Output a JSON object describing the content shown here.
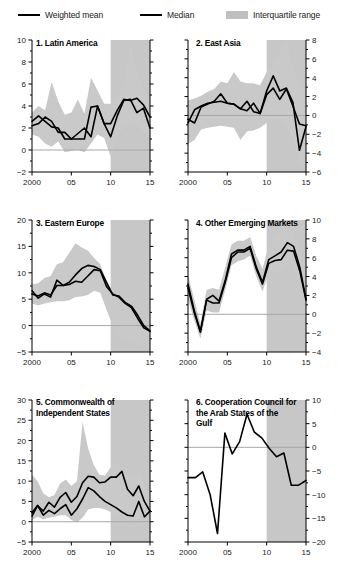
{
  "legend": {
    "items": [
      {
        "label": "Weighted mean",
        "marker": "line",
        "color": "#000000"
      },
      {
        "label": "Median",
        "marker": "line",
        "color": "#000000"
      },
      {
        "label": "Interquartile range",
        "marker": "band",
        "color": "#bfbfbf"
      }
    ]
  },
  "colors": {
    "line": "#000000",
    "iqr_band": "#c9c9c9",
    "forecast_shade": "#b2b2b2",
    "zero_line": "#a8a8a8",
    "axis": "#000000",
    "background": "#ffffff"
  },
  "chart_data": [
    {
      "type": "line",
      "title": "1. Latin America",
      "panel_number": 1,
      "xlabel": "",
      "ylabel": "",
      "axis_side": "left",
      "xlim": [
        2000,
        2015
      ],
      "ylim": [
        -2,
        10
      ],
      "yticks": [
        -2,
        0,
        2,
        4,
        6,
        8,
        10
      ],
      "xticks": [
        2000,
        2005,
        2010,
        2015
      ],
      "xtick_labels": [
        "2000",
        "05",
        "10",
        "15"
      ],
      "grid": false,
      "zero_line": true,
      "shaded_region": {
        "from": 2010,
        "to": 2015,
        "note": "forecast"
      },
      "x": [
        2000,
        2001,
        2002,
        2003,
        2004,
        2005,
        2006,
        2007,
        2008,
        2009,
        2010,
        2011,
        2012,
        2013,
        2014,
        2015
      ],
      "series": [
        {
          "name": "Weighted mean",
          "values": [
            2.6,
            3.1,
            2.6,
            2.1,
            2.0,
            1.0,
            1.0,
            1.5,
            2.0,
            1.2,
            4.0,
            2.4,
            2.4,
            3.6,
            4.6,
            4.5,
            4.7,
            4.1,
            3.0
          ]
        },
        {
          "name": "Median",
          "values": [
            2.2,
            2.4,
            3.0,
            2.6,
            1.6,
            1.6,
            1.0,
            1.0,
            1.0,
            3.9,
            4.0,
            2.4,
            1.2,
            3.1,
            4.5,
            4.6,
            3.4,
            3.8,
            2.0
          ]
        }
      ],
      "iqr": {
        "lower": [
          1.4,
          1.2,
          0.6,
          0.3,
          0.8,
          -0.2,
          -0.1,
          0.0,
          -0.2,
          0.6,
          1.4,
          1.1,
          -0.6,
          1.2,
          2.0,
          2.4,
          2.3,
          1.6,
          0.9
        ],
        "upper": [
          3.4,
          4.0,
          3.6,
          6.2,
          4.4,
          3.2,
          3.4,
          4.6,
          3.3,
          6.6,
          5.4,
          4.2,
          4.2,
          4.9,
          6.1,
          9.7,
          7.2,
          5.4,
          4.6
        ]
      }
    },
    {
      "type": "line",
      "title": "2. East Asia",
      "panel_number": 2,
      "xlabel": "",
      "ylabel": "",
      "axis_side": "right",
      "xlim": [
        2000,
        2015
      ],
      "ylim": [
        -6,
        8
      ],
      "yticks": [
        -6,
        -4,
        -2,
        0,
        2,
        4,
        6,
        8
      ],
      "xticks": [
        2000,
        2005,
        2010,
        2015
      ],
      "xtick_labels": [
        "2000",
        "05",
        "10",
        "15"
      ],
      "grid": false,
      "zero_line": true,
      "shaded_region": {
        "from": 2010,
        "to": 2015,
        "note": "forecast"
      },
      "x": [
        2000,
        2001,
        2002,
        2003,
        2004,
        2005,
        2006,
        2007,
        2008,
        2009,
        2010,
        2011,
        2012,
        2013,
        2014,
        2015
      ],
      "series": [
        {
          "name": "Weighted mean",
          "values": [
            -0.8,
            0.6,
            1.0,
            1.3,
            1.4,
            1.5,
            1.3,
            1.2,
            0.7,
            1.5,
            0.4,
            0.2,
            2.6,
            4.2,
            2.6,
            2.9,
            1.4,
            -3.7,
            -1.2
          ]
        },
        {
          "name": "Median",
          "values": [
            -0.4,
            -0.8,
            0.9,
            1.2,
            1.5,
            2.3,
            1.3,
            1.2,
            0.7,
            0.5,
            1.3,
            0.2,
            2.2,
            2.9,
            1.7,
            2.8,
            1.0,
            -0.9,
            -1.1
          ]
        }
      ],
      "iqr": {
        "lower": [
          -3.0,
          -2.6,
          -1.5,
          -1.3,
          -1.2,
          -1.1,
          -1.2,
          -1.3,
          -2.6,
          -1.7,
          -1.6,
          -1.3,
          -0.8,
          -0.6,
          -0.4,
          -1.2,
          -2.4,
          -5.0,
          -5.8
        ],
        "upper": [
          1.6,
          1.8,
          2.1,
          2.5,
          2.8,
          3.6,
          3.4,
          4.6,
          3.6,
          3.4,
          3.4,
          3.2,
          4.6,
          5.6,
          6.8,
          7.8,
          5.2,
          3.2,
          2.4
        ]
      }
    },
    {
      "type": "line",
      "title": "3. Eastern Europe",
      "panel_number": 3,
      "xlabel": "",
      "ylabel": "",
      "axis_side": "left",
      "xlim": [
        2000,
        2015
      ],
      "ylim": [
        -5,
        20
      ],
      "yticks": [
        -5,
        0,
        5,
        10,
        15,
        20
      ],
      "xticks": [
        2000,
        2005,
        2010,
        2015
      ],
      "xtick_labels": [
        "2000",
        "05",
        "10",
        "15"
      ],
      "grid": false,
      "zero_line": true,
      "shaded_region": {
        "from": 2010,
        "to": 2015,
        "note": "forecast"
      },
      "x": [
        2000,
        2001,
        2002,
        2003,
        2004,
        2005,
        2006,
        2007,
        2008,
        2009,
        2010,
        2011,
        2012,
        2013,
        2014,
        2015
      ],
      "series": [
        {
          "name": "Weighted mean",
          "values": [
            6.6,
            5.2,
            6.0,
            5.4,
            8.6,
            7.6,
            8.2,
            9.6,
            10.8,
            11.4,
            11.2,
            10.6,
            8.2,
            5.8,
            5.6,
            4.4,
            3.7,
            2.0,
            0.0,
            -1.0
          ]
        },
        {
          "name": "Median",
          "values": [
            6.0,
            5.6,
            6.2,
            5.8,
            7.6,
            7.6,
            7.8,
            8.4,
            8.2,
            9.4,
            10.6,
            10.4,
            7.4,
            6.0,
            5.4,
            4.2,
            3.4,
            1.4,
            -0.4,
            -1.1
          ]
        }
      ],
      "iqr": {
        "lower": [
          4.2,
          3.8,
          4.2,
          4.4,
          4.6,
          4.6,
          4.8,
          5.4,
          5.5,
          5.8,
          6.6,
          6.2,
          3.0,
          0.0,
          -2.4,
          -2.6,
          -3.2,
          -3.6,
          -3.6,
          -3.8
        ],
        "upper": [
          7.8,
          8.0,
          9.0,
          9.4,
          11.6,
          12.0,
          13.8,
          15.6,
          14.8,
          14.2,
          12.8,
          11.6,
          8.4,
          6.6,
          5.8,
          5.4,
          4.6,
          3.0,
          1.2,
          0.6
        ]
      }
    },
    {
      "type": "line",
      "title": "4. Other Emerging Markets",
      "panel_number": 4,
      "xlabel": "",
      "ylabel": "",
      "axis_side": "right",
      "xlim": [
        2000,
        2015
      ],
      "ylim": [
        -4,
        10
      ],
      "yticks": [
        -4,
        -2,
        0,
        2,
        4,
        6,
        8,
        10
      ],
      "xticks": [
        2000,
        2005,
        2010,
        2015
      ],
      "xtick_labels": [
        "2000",
        "05",
        "10",
        "15"
      ],
      "grid": false,
      "zero_line": true,
      "shaded_region": {
        "from": 2010,
        "to": 2015,
        "note": "forecast"
      },
      "x": [
        2000,
        2001,
        2002,
        2003,
        2004,
        2005,
        2006,
        2007,
        2008,
        2009,
        2010,
        2011,
        2012,
        2013,
        2014,
        2015
      ],
      "series": [
        {
          "name": "Weighted mean",
          "values": [
            3.2,
            0.4,
            -1.8,
            1.6,
            2.0,
            1.4,
            3.6,
            6.4,
            6.8,
            6.8,
            7.2,
            5.0,
            3.4,
            5.8,
            6.2,
            6.6,
            7.6,
            7.2,
            5.0,
            1.6
          ]
        },
        {
          "name": "Median",
          "values": [
            2.8,
            0.2,
            -1.9,
            1.5,
            1.2,
            1.2,
            3.4,
            6.0,
            6.6,
            6.6,
            7.0,
            4.8,
            3.2,
            5.4,
            5.7,
            5.8,
            6.8,
            6.7,
            4.6,
            1.5
          ]
        }
      ],
      "iqr": {
        "lower": [
          1.6,
          -0.6,
          -2.6,
          0.4,
          0.2,
          0.2,
          2.6,
          5.2,
          5.6,
          5.8,
          6.2,
          4.0,
          2.4,
          4.4,
          4.6,
          4.6,
          5.4,
          5.2,
          3.4,
          0.6
        ],
        "upper": [
          4.2,
          1.6,
          -1.0,
          2.6,
          2.8,
          2.6,
          5.0,
          7.4,
          7.8,
          7.8,
          8.2,
          6.2,
          4.8,
          7.4,
          8.4,
          9.0,
          9.2,
          8.6,
          6.6,
          3.0
        ]
      }
    },
    {
      "type": "line",
      "title": "5. Commonwealth of\nIndependent States",
      "panel_number": 5,
      "xlabel": "",
      "ylabel": "",
      "axis_side": "left",
      "xlim": [
        2000,
        2015
      ],
      "ylim": [
        -5,
        30
      ],
      "yticks": [
        -5,
        0,
        5,
        10,
        15,
        20,
        25,
        30
      ],
      "xticks": [
        2000,
        2005,
        2010,
        2015
      ],
      "xtick_labels": [
        "2000",
        "05",
        "10",
        "15"
      ],
      "grid": false,
      "zero_line": true,
      "shaded_region": {
        "from": 2010,
        "to": 2015,
        "note": "forecast"
      },
      "x": [
        2000,
        2001,
        2002,
        2003,
        2004,
        2005,
        2006,
        2007,
        2008,
        2009,
        2010,
        2011,
        2012,
        2013,
        2014,
        2015
      ],
      "series": [
        {
          "name": "Weighted mean",
          "values": [
            1.4,
            4.0,
            2.6,
            4.8,
            3.6,
            6.0,
            7.2,
            4.8,
            6.2,
            9.6,
            11.2,
            11.0,
            9.6,
            9.8,
            11.0,
            11.0,
            12.4,
            8.0,
            6.4,
            8.8,
            5.0,
            2.6
          ]
        },
        {
          "name": "Median",
          "values": [
            2.2,
            4.0,
            1.6,
            2.8,
            2.0,
            3.2,
            4.2,
            1.6,
            3.2,
            5.6,
            8.4,
            7.6,
            6.2,
            5.0,
            4.2,
            3.4,
            2.4,
            1.6,
            1.4,
            5.0,
            1.2,
            2.6
          ]
        }
      ],
      "iqr": {
        "lower": [
          0.4,
          1.2,
          0.6,
          1.0,
          1.2,
          1.6,
          1.6,
          0.4,
          -0.2,
          1.0,
          3.0,
          3.4,
          3.4,
          3.0,
          2.4,
          1.6,
          1.2,
          0.6,
          0.2,
          0.8,
          0.4,
          0.6
        ],
        "upper": [
          11.6,
          10.0,
          7.0,
          6.0,
          6.6,
          9.4,
          10.4,
          8.8,
          10.0,
          24.6,
          18.0,
          14.0,
          11.6,
          11.4,
          13.4,
          14.8,
          12.6,
          11.4,
          10.6,
          12.6,
          9.0,
          6.4
        ]
      }
    },
    {
      "type": "line",
      "title": "6. Cooperation Council for\nthe Arab States of the\nGulf",
      "panel_number": 6,
      "xlabel": "",
      "ylabel": "",
      "axis_side": "right",
      "xlim": [
        2000,
        2015
      ],
      "ylim": [
        -20,
        10
      ],
      "yticks": [
        -20,
        -15,
        -10,
        -5,
        0,
        5,
        10
      ],
      "xticks": [
        2000,
        2005,
        2010,
        2015
      ],
      "xtick_labels": [
        "2000",
        "05",
        "10",
        "15"
      ],
      "grid": false,
      "zero_line": true,
      "shaded_region": {
        "from": 2010,
        "to": 2015,
        "note": "forecast"
      },
      "x": [
        2000,
        2001,
        2002,
        2003,
        2004,
        2005,
        2006,
        2007,
        2008,
        2009,
        2010,
        2011,
        2012,
        2013,
        2014,
        2015
      ],
      "series": [
        {
          "name": "Weighted mean",
          "values": [
            -6.4,
            -6.4,
            -5.2,
            -10.0,
            -18.2,
            3.0,
            -1.4,
            1.2,
            7.0,
            3.2,
            2.0,
            -0.2,
            -2.0,
            -1.2,
            -8.0,
            -8.0,
            -7.0
          ]
        }
      ],
      "iqr": null
    }
  ]
}
